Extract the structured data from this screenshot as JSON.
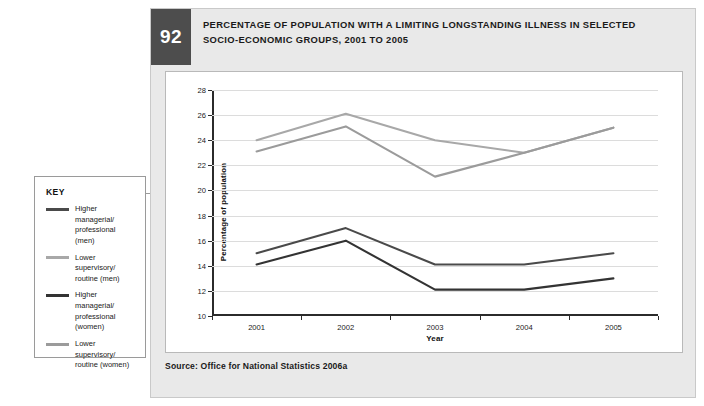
{
  "figure": {
    "number": "92",
    "title_line1": "PERCENTAGE OF POPULATION WITH A LIMITING LONGSTANDING ILLNESS IN SELECTED",
    "title_line2": "SOCIO-ECONOMIC GROUPS, 2001 TO 2005",
    "source": "Source: Office for National Statistics 2006a"
  },
  "key": {
    "title": "KEY",
    "items": [
      {
        "label": "Higher managerial/ professional (men)",
        "color": "#4a4a4a"
      },
      {
        "label": "Lower supervisory/ routine (men)",
        "color": "#a8a8a8"
      },
      {
        "label": "Higher managerial/ professional (women)",
        "color": "#333333"
      },
      {
        "label": "Lower supervisory/ routine (women)",
        "color": "#9b9b9b"
      }
    ]
  },
  "colors": {
    "badge_background": "#4d4d4d",
    "panel_background": "#e9e9e9",
    "grid": "#dcdcdc",
    "axis": "#2b2b2b"
  },
  "chart_data": {
    "type": "line",
    "title": "Percentage of population with a limiting longstanding illness in selected socio-economic groups, 2001 to 2005",
    "xlabel": "Year",
    "ylabel": "Percentage of population",
    "categories": [
      "2001",
      "2002",
      "2003",
      "2004",
      "2005"
    ],
    "x": [
      2001,
      2002,
      2003,
      2004,
      2005
    ],
    "ylim": [
      10,
      28
    ],
    "yticks": [
      10,
      12,
      14,
      16,
      18,
      20,
      22,
      24,
      26,
      28
    ],
    "grid": true,
    "legend_position": "external-left",
    "series": [
      {
        "name": "Higher managerial/ professional (men)",
        "color": "#4a4a4a",
        "values": [
          15.0,
          17.0,
          14.1,
          14.1,
          15.0
        ]
      },
      {
        "name": "Lower supervisory/ routine (men)",
        "color": "#a8a8a8",
        "values": [
          24.0,
          26.1,
          24.0,
          23.0,
          25.0
        ]
      },
      {
        "name": "Higher managerial/ professional (women)",
        "color": "#333333",
        "values": [
          14.1,
          16.0,
          12.1,
          12.1,
          13.0
        ]
      },
      {
        "name": "Lower supervisory/ routine (women)",
        "color": "#9b9b9b",
        "values": [
          23.1,
          25.1,
          21.1,
          23.0,
          25.0
        ]
      }
    ]
  }
}
